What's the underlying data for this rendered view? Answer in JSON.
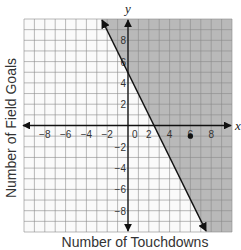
{
  "chart_data": {
    "type": "line",
    "title": "",
    "xlabel": "Number of Touchdowns",
    "ylabel": "Number of Field Goals",
    "x_axis_name": "x",
    "y_axis_name": "y",
    "xlim": [
      -10,
      10
    ],
    "ylim": [
      -10,
      10
    ],
    "grid": true,
    "grid_step": 1,
    "x_ticks": [
      -8,
      -6,
      -4,
      -2,
      0,
      2,
      4,
      6,
      8
    ],
    "y_ticks": [
      -8,
      -6,
      -4,
      -2,
      2,
      4,
      6,
      8
    ],
    "boundary_line": {
      "equation": "y = -2x + 5",
      "slope": -2,
      "intercept": 5,
      "style": "solid",
      "points": [
        [
          0,
          5
        ],
        [
          2.5,
          0
        ]
      ]
    },
    "shaded_region": "y >= -2x + 5 (right of line)",
    "shade_color": "#b9b9b9",
    "points": [
      {
        "x": 6,
        "y": -1
      }
    ],
    "legend": null
  },
  "labels": {
    "xlabel": "Number of Touchdowns",
    "ylabel": "Number of Field Goals"
  }
}
